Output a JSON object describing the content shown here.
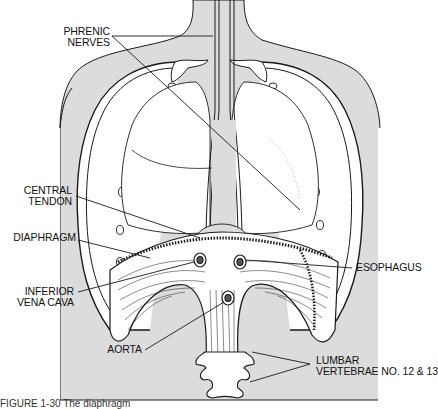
{
  "figure": {
    "labels": {
      "phrenic_nerves": [
        "PHRENIC",
        "NERVES"
      ],
      "central_tendon": [
        "CENTRAL",
        "TENDON"
      ],
      "diaphragm": "DIAPHRAGM",
      "inferior_vena_cava": [
        "INFERIOR",
        "VENA CAVA"
      ],
      "aorta": "AORTA",
      "esophagus": "ESOPHAGUS",
      "lumbar_vertebrae": [
        "LUMBAR",
        "VERTEBRAE NO. 12 & 13"
      ]
    },
    "caption": "FIGURE 1-30   The diaphragm"
  },
  "colors": {
    "ink": "#1a1a1a",
    "body_fill": "#dcdcdc",
    "background": "#ffffff"
  }
}
